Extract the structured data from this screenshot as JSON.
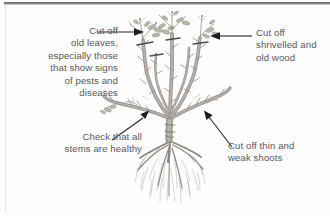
{
  "figure": {
    "background_color": "#fdfdfd",
    "label_color": "#57585a",
    "caption_color": "#1b2a6b"
  },
  "labels": {
    "old_leaves": "Cut off\nold leaves,\nespecially those\nthat show signs\nof pests and\ndiseases",
    "shrivelled_wood": "Cut off\nshrivelled and\nold wood",
    "check_stems": "Check that all\nstems are healthy",
    "thin_weak_shoots": "Cut off thin and\nweak shoots"
  },
  "caption": {
    "text": "Planting a new Pruning and training"
  },
  "icons": {
    "arrow_right": "arrow-right-icon",
    "arrow_left": "arrow-left-icon",
    "arrow_upright": "arrow-up-right-icon",
    "arrow_upleft": "arrow-up-left-icon"
  },
  "illustration": {
    "name": "shrub-with-roots",
    "parts": [
      "leaves",
      "stems",
      "cut-marks",
      "thin-shoots",
      "root-ball"
    ]
  }
}
